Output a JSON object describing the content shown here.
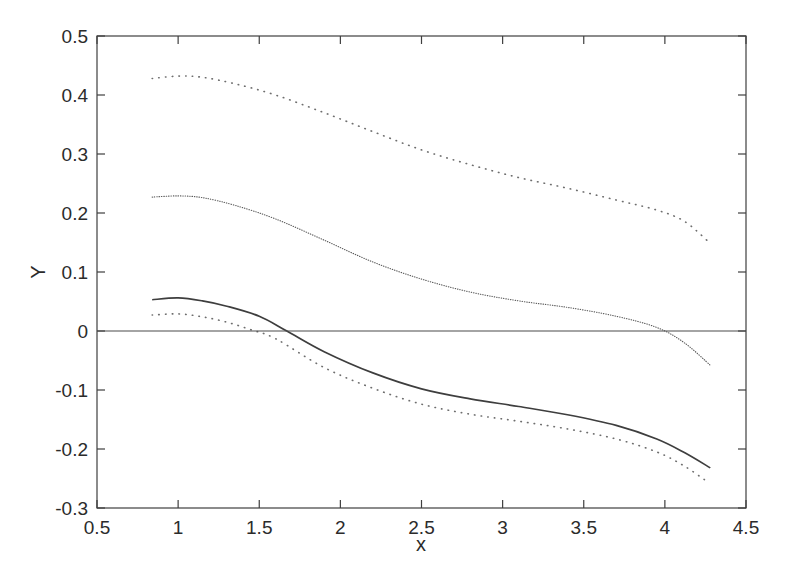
{
  "figure": {
    "background": "#ffffff",
    "axis_color": "#3f3f3f",
    "text_color": "#2b2b2b"
  },
  "chart_data": {
    "type": "line",
    "title": "",
    "xlabel": "x",
    "ylabel": "Y",
    "xlim": [
      0.5,
      4.5
    ],
    "ylim": [
      -0.3,
      0.5
    ],
    "xticks": [
      0.5,
      1,
      1.5,
      2,
      2.5,
      3,
      3.5,
      4,
      4.5
    ],
    "xtick_labels": [
      "0.5",
      "1",
      "1.5",
      "2",
      "2.5",
      "3",
      "3.5",
      "4",
      "4.5"
    ],
    "yticks": [
      -0.3,
      -0.2,
      -0.1,
      0,
      0.1,
      0.2,
      0.3,
      0.4,
      0.5
    ],
    "ytick_labels": [
      "-0.3",
      "-0.2",
      "-0.1",
      "0",
      "0.1",
      "0.2",
      "0.3",
      "0.4",
      "0.5"
    ],
    "grid": false,
    "legend": null,
    "series": [
      {
        "name": "upper-dotted-curve",
        "linestyle": "dotted",
        "color": "#6e6e6e",
        "x": [
          0.84,
          1.0,
          1.15,
          1.35,
          1.6,
          1.9,
          2.2,
          2.5,
          2.8,
          3.1,
          3.4,
          3.7,
          3.95,
          4.12,
          4.27
        ],
        "y": [
          0.428,
          0.432,
          0.43,
          0.419,
          0.4,
          0.37,
          0.338,
          0.307,
          0.282,
          0.26,
          0.242,
          0.222,
          0.205,
          0.186,
          0.151
        ]
      },
      {
        "name": "middle-fine-dotted-curve",
        "linestyle": "fine-dotted",
        "color": "#5c5c5c",
        "x": [
          0.84,
          1.0,
          1.15,
          1.35,
          1.6,
          1.9,
          2.2,
          2.5,
          2.8,
          3.1,
          3.4,
          3.7,
          3.95,
          4.12,
          4.28
        ],
        "y": [
          0.227,
          0.229,
          0.226,
          0.213,
          0.19,
          0.154,
          0.117,
          0.088,
          0.066,
          0.051,
          0.04,
          0.025,
          0.006,
          -0.02,
          -0.058
        ]
      },
      {
        "name": "solid-curve",
        "linestyle": "solid",
        "color": "#3e3e3e",
        "x": [
          0.84,
          1.0,
          1.15,
          1.3,
          1.5,
          1.67,
          1.9,
          2.2,
          2.5,
          2.8,
          3.1,
          3.4,
          3.7,
          3.95,
          4.12,
          4.28
        ],
        "y": [
          0.053,
          0.056,
          0.051,
          0.042,
          0.025,
          0.0,
          -0.035,
          -0.071,
          -0.098,
          -0.115,
          -0.128,
          -0.142,
          -0.16,
          -0.183,
          -0.206,
          -0.232
        ]
      },
      {
        "name": "lower-dotted-curve",
        "linestyle": "dotted",
        "color": "#6e6e6e",
        "x": [
          0.84,
          1.0,
          1.15,
          1.3,
          1.45,
          1.6,
          1.9,
          2.2,
          2.5,
          2.8,
          3.1,
          3.4,
          3.7,
          3.95,
          4.12,
          4.27
        ],
        "y": [
          0.027,
          0.029,
          0.024,
          0.015,
          0.002,
          -0.013,
          -0.062,
          -0.097,
          -0.124,
          -0.141,
          -0.153,
          -0.166,
          -0.183,
          -0.205,
          -0.229,
          -0.257
        ]
      },
      {
        "name": "zero-reference-line",
        "linestyle": "hairline",
        "color": "#4a4a4a",
        "x": [
          0.5,
          4.5
        ],
        "y": [
          0,
          0
        ]
      }
    ]
  }
}
